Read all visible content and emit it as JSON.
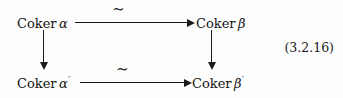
{
  "diagram": {
    "type": "commutative-square",
    "nodes": {
      "top_left": {
        "text": "Coker",
        "symbol": "α",
        "prime": ""
      },
      "top_right": {
        "text": "Coker",
        "symbol": "β",
        "prime": ""
      },
      "bottom_left": {
        "text": "Coker",
        "symbol": "α",
        "prime": "′"
      },
      "bottom_right": {
        "text": "Coker",
        "symbol": "β",
        "prime": "′"
      }
    },
    "arrows": {
      "top_horizontal": {
        "label": "∼",
        "direction": "right",
        "meaning": "isomorphism"
      },
      "bottom_horizontal": {
        "label": "∼",
        "direction": "right",
        "meaning": "isomorphism"
      },
      "left_vertical": {
        "label": "",
        "direction": "down",
        "meaning": "induced map"
      },
      "right_vertical": {
        "label": "",
        "direction": "down",
        "meaning": "induced map"
      }
    },
    "equation_tag": "(3.2.16)",
    "colors": {
      "ink": "#1a1a1a",
      "background": "#fdfdfd"
    }
  }
}
